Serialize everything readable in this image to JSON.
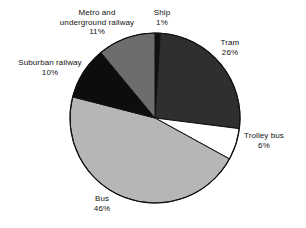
{
  "chart_data": {
    "type": "pie",
    "title": "",
    "subtitle": "",
    "xlabel": "",
    "ylabel": "",
    "legend_position": "none",
    "grid": false,
    "units": "percent",
    "start_angle_deg": 0,
    "direction": "clockwise",
    "categories": [
      "Ship",
      "Tram",
      "Trolley bus",
      "Bus",
      "Suburban railway",
      "Metro and underground railway"
    ],
    "values": [
      1,
      26,
      6,
      46,
      10,
      11
    ],
    "total": 100,
    "slices": [
      {
        "name": "Ship",
        "label": "Ship",
        "value": 1,
        "pct_text": "1%",
        "color": "#111111",
        "stroke": "#111111"
      },
      {
        "name": "Tram",
        "label": "Tram",
        "value": 26,
        "pct_text": "26%",
        "color": "#2f2f2f",
        "stroke": "#111111"
      },
      {
        "name": "Trolley bus",
        "label": "Trolley bus",
        "value": 6,
        "pct_text": "6%",
        "color": "#ffffff",
        "stroke": "#111111"
      },
      {
        "name": "Bus",
        "label": "Bus",
        "value": 46,
        "pct_text": "46%",
        "color": "#b6b6b6",
        "stroke": "#111111"
      },
      {
        "name": "Suburban railway",
        "label": "Suburban railway",
        "value": 10,
        "pct_text": "10%",
        "color": "#0d0d0d",
        "stroke": "#111111"
      },
      {
        "name": "Metro and underground railway",
        "label": "Metro and underground railway",
        "value": 11,
        "pct_text": "11%",
        "color": "#6d6d6d",
        "stroke": "#111111"
      }
    ]
  },
  "labels": {
    "metro": {
      "line1": "Metro and",
      "line2": "underground railway",
      "pct": "11%"
    },
    "ship": {
      "line1": "Ship",
      "pct": "1%"
    },
    "tram": {
      "line1": "Tram",
      "pct": "26%"
    },
    "trolley": {
      "line1": "Trolley bus",
      "pct": "6%"
    },
    "bus": {
      "line1": "Bus",
      "pct": "46%"
    },
    "suburban": {
      "line1": "Suburban railway",
      "pct": "10%"
    }
  },
  "geometry": {
    "cx": 155,
    "cy": 118,
    "r": 85
  }
}
